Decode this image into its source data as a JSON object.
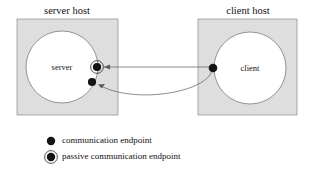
{
  "figure": {
    "title": "",
    "type": "network-communication-diagram"
  },
  "hosts": [
    {
      "id": "server-host",
      "title": "server host",
      "title_x": 67,
      "title_y": 14,
      "box": {
        "x": 17,
        "y": 19,
        "w": 101,
        "h": 96
      },
      "fill": "#dededf",
      "stroke": "#8a8a8a",
      "process": {
        "id": "server",
        "label": "server",
        "cx": 62,
        "cy": 67,
        "r": 36,
        "label_x": 62,
        "label_y": 70
      }
    },
    {
      "id": "client-host",
      "title": "client host",
      "title_x": 248,
      "title_y": 14,
      "box": {
        "x": 198,
        "y": 19,
        "w": 99,
        "h": 96
      },
      "fill": "#dededf",
      "stroke": "#8a8a8a",
      "process": {
        "id": "client",
        "label": "client",
        "cx": 250,
        "cy": 68,
        "r": 36,
        "label_x": 250,
        "label_y": 71
      }
    }
  ],
  "endpoints": [
    {
      "id": "server-passive-endpoint",
      "kind": "passive",
      "cx": 97,
      "cy": 67,
      "r": 4.1,
      "ring_r": 6.4,
      "color": "#141414"
    },
    {
      "id": "server-active-endpoint",
      "kind": "active",
      "cx": 92,
      "cy": 82,
      "r": 4.1,
      "color": "#141414"
    },
    {
      "id": "client-endpoint",
      "kind": "active",
      "cx": 213,
      "cy": 68,
      "r": 4.3,
      "color": "#141414"
    }
  ],
  "connections": [
    {
      "id": "connection-request-straight",
      "shape": "line",
      "path": "M 212 67 L 104 67",
      "arrow_at": "start-side",
      "arrow_points": "104,67 110,64.6 110,69.4",
      "stroke": "#5a5a5a"
    },
    {
      "id": "connection-established-curve",
      "shape": "curve",
      "path": "M 212 70 C 208 92 135 105 99 85",
      "arrow_at": "server-end",
      "arrow_points": "98,84.4 105,84 101.6,88.6",
      "stroke": "#5a5a5a"
    }
  ],
  "legend": {
    "items": [
      {
        "id": "legend-communication-endpoint",
        "label": "communication endpoint",
        "kind": "active",
        "marker_cx": 51,
        "marker_cy": 141,
        "marker_r": 4.2,
        "label_x": 62,
        "label_y": 141
      },
      {
        "id": "legend-passive-communication-endpoint",
        "label": "passive communication endpoint",
        "kind": "passive",
        "marker_cx": 51,
        "marker_cy": 157,
        "marker_r": 4.2,
        "marker_ring_r": 6.4,
        "label_x": 62,
        "label_y": 157
      }
    ]
  },
  "colors": {
    "host_fill": "#dededf",
    "host_stroke": "#8a8a8a",
    "process_fill": "#ffffff",
    "process_stroke": "#6e6e6e",
    "endpoint": "#141414",
    "connector": "#5a5a5a",
    "text": "#111111",
    "background": "#ffffff"
  }
}
